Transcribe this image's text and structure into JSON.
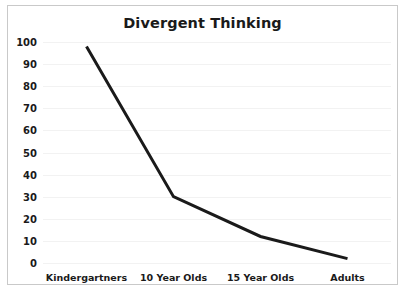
{
  "chart_data": {
    "type": "line",
    "title": "Divergent Thinking",
    "xlabel": "",
    "ylabel": "",
    "categories": [
      "Kindergartners",
      "10 Year Olds",
      "15 Year Olds",
      "Adults"
    ],
    "values": [
      98,
      30,
      12,
      2
    ],
    "series": [
      {
        "name": "Divergent Thinking",
        "values": [
          98,
          30,
          12,
          2
        ]
      }
    ],
    "ylim": [
      0,
      100
    ],
    "yticks": [
      0,
      10,
      20,
      30,
      40,
      50,
      60,
      70,
      80,
      90,
      100
    ],
    "ytick_labels": [
      "0",
      "10",
      "20",
      "30",
      "40",
      "50",
      "60",
      "70",
      "80",
      "90",
      "100"
    ],
    "grid": true,
    "legend": false,
    "legend_position": "none",
    "line_color": "#1a1a1a",
    "line_width": 3,
    "grid_color": "#f2f2f2",
    "border_color": "#c9c9c9",
    "background_color": "#ffffff"
  }
}
